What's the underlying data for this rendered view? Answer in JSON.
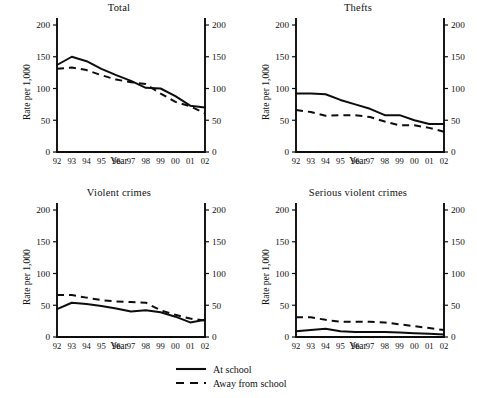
{
  "figure": {
    "ylabel": "Rate per 1,000",
    "xlabel": "Year",
    "yticks": [
      "0",
      "50",
      "100",
      "150",
      "200"
    ],
    "xticks": [
      "92",
      "93",
      "94",
      "95",
      "96",
      "97",
      "98",
      "99",
      "00",
      "01",
      "02"
    ],
    "line_color": "#0d0d0d"
  },
  "legend": {
    "position": "bottom-center",
    "entries": [
      {
        "label": "At school",
        "style": "solid",
        "swatch": "solid-line-swatch"
      },
      {
        "label": "Away from school",
        "style": "dashed",
        "swatch": "dashed-line-swatch"
      }
    ]
  },
  "chart_data": [
    {
      "type": "line",
      "title": "Total",
      "xlabel": "Year",
      "ylabel": "Rate per 1,000",
      "x": [
        "92",
        "93",
        "94",
        "95",
        "96",
        "97",
        "98",
        "99",
        "00",
        "01",
        "02"
      ],
      "ylim": [
        0,
        200
      ],
      "yticks": [
        0,
        50,
        100,
        150,
        200
      ],
      "grid": false,
      "series": [
        {
          "name": "At school",
          "style": "solid",
          "values": [
            137,
            150,
            143,
            131,
            121,
            112,
            101,
            100,
            88,
            73,
            70
          ]
        },
        {
          "name": "Away from school",
          "style": "dashed",
          "values": [
            131,
            133,
            129,
            121,
            114,
            110,
            107,
            92,
            79,
            72,
            61
          ]
        }
      ]
    },
    {
      "type": "line",
      "title": "Thefts",
      "xlabel": "Year",
      "ylabel": "Rate per 1,000",
      "x": [
        "92",
        "93",
        "94",
        "95",
        "96",
        "97",
        "98",
        "99",
        "00",
        "01",
        "02"
      ],
      "ylim": [
        0,
        200
      ],
      "yticks": [
        0,
        50,
        100,
        150,
        200
      ],
      "grid": false,
      "series": [
        {
          "name": "At school",
          "style": "solid",
          "values": [
            92,
            92,
            91,
            82,
            75,
            68,
            58,
            58,
            50,
            44,
            44
          ]
        },
        {
          "name": "Away from school",
          "style": "dashed",
          "values": [
            66,
            63,
            57,
            58,
            58,
            55,
            48,
            42,
            42,
            38,
            32
          ]
        }
      ]
    },
    {
      "type": "line",
      "title": "Violent crimes",
      "xlabel": "Year",
      "ylabel": "Rate per 1,000",
      "x": [
        "92",
        "93",
        "94",
        "95",
        "96",
        "97",
        "98",
        "99",
        "00",
        "01",
        "02"
      ],
      "ylim": [
        0,
        200
      ],
      "yticks": [
        0,
        50,
        100,
        150,
        200
      ],
      "grid": false,
      "series": [
        {
          "name": "At school",
          "style": "solid",
          "values": [
            44,
            54,
            52,
            49,
            45,
            40,
            42,
            39,
            32,
            23,
            27
          ]
        },
        {
          "name": "Away from school",
          "style": "dashed",
          "values": [
            66,
            66,
            62,
            58,
            56,
            55,
            54,
            42,
            35,
            29,
            26
          ]
        }
      ]
    },
    {
      "type": "line",
      "title": "Serious violent crimes",
      "xlabel": "Year",
      "ylabel": "Rate per 1,000",
      "x": [
        "92",
        "93",
        "94",
        "95",
        "96",
        "97",
        "98",
        "99",
        "00",
        "01",
        "02"
      ],
      "ylim": [
        0,
        200
      ],
      "yticks": [
        0,
        50,
        100,
        150,
        200
      ],
      "grid": false,
      "series": [
        {
          "name": "At school",
          "style": "solid",
          "values": [
            9,
            11,
            13,
            9,
            8,
            8,
            8,
            7,
            6,
            5,
            4
          ]
        },
        {
          "name": "Away from school",
          "style": "dashed",
          "values": [
            31,
            31,
            27,
            24,
            24,
            24,
            23,
            20,
            17,
            14,
            11
          ]
        }
      ]
    }
  ]
}
